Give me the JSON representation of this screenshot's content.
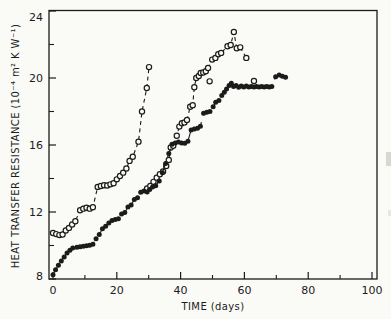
{
  "chart_data": {
    "type": "scatter",
    "title": "",
    "xlabel": "TIME (days)",
    "ylabel": "HEAT TRANSFER RESISTANCE (10⁻⁴ m² K W⁻¹)",
    "xlim": [
      0,
      100
    ],
    "ylim": [
      8,
      24
    ],
    "xticks_major": [
      0,
      20,
      40,
      60,
      80,
      100
    ],
    "xticks_minor": [
      10,
      30,
      50,
      70,
      90
    ],
    "yticks_major": [
      8,
      12,
      16,
      20,
      24
    ],
    "yticks_minor": [
      10,
      14,
      18,
      22
    ],
    "grid": false,
    "legend": "none",
    "colors": {
      "ink": "#1b1b1b",
      "background": "#fafaf7"
    },
    "series": [
      {
        "name": "run-1-open-circles",
        "marker": "open-circle",
        "line": "dashed",
        "points": [
          [
            0,
            10.75
          ],
          [
            1,
            10.68
          ],
          [
            2,
            10.62
          ],
          [
            3,
            10.66
          ],
          [
            4,
            10.9
          ],
          [
            5,
            11.05
          ],
          [
            6,
            11.25
          ],
          [
            7,
            11.45
          ],
          [
            8.5,
            12.1
          ],
          [
            9.5,
            12.2
          ],
          [
            10.5,
            12.25
          ],
          [
            11.5,
            12.2
          ],
          [
            12.5,
            12.28
          ],
          [
            14,
            13.5
          ],
          [
            15,
            13.55
          ],
          [
            16,
            13.6
          ],
          [
            17,
            13.58
          ],
          [
            18,
            13.65
          ],
          [
            19,
            13.72
          ],
          [
            20,
            13.95
          ],
          [
            21,
            14.15
          ],
          [
            22,
            14.35
          ],
          [
            23,
            14.6
          ],
          [
            24,
            15.05
          ],
          [
            25,
            15.3
          ],
          [
            26.8,
            16.2
          ],
          [
            27.9,
            18.0
          ],
          [
            29.4,
            19.4
          ],
          [
            30.1,
            20.65
          ]
        ],
        "no_line_points": []
      },
      {
        "name": "run-2-open-circles",
        "marker": "open-circle",
        "line": "dashed",
        "points": [
          [
            29.5,
            13.4
          ],
          [
            30.5,
            13.55
          ],
          [
            31.5,
            13.8
          ],
          [
            32.5,
            14.05
          ],
          [
            33.5,
            14.25
          ],
          [
            34.5,
            14.42
          ],
          [
            35.5,
            14.75
          ],
          [
            36.3,
            15.1
          ],
          [
            36.9,
            15.85
          ],
          [
            37.7,
            15.95
          ],
          [
            38.8,
            16.55
          ],
          [
            39.6,
            17.1
          ],
          [
            40.4,
            17.3
          ],
          [
            41.2,
            17.35
          ],
          [
            42,
            17.5
          ],
          [
            43,
            18.28
          ],
          [
            43.8,
            18.38
          ],
          [
            44.3,
            19.45
          ],
          [
            44.9,
            20.0
          ],
          [
            45.7,
            20.12
          ],
          [
            46.3,
            20.3
          ],
          [
            47.1,
            20.33
          ],
          [
            47.9,
            20.4
          ],
          [
            48.6,
            20.6
          ],
          [
            49.9,
            21.1
          ],
          [
            50.9,
            21.2
          ],
          [
            51.8,
            21.42
          ],
          [
            52.7,
            21.5
          ],
          [
            54.7,
            21.9
          ],
          [
            55.7,
            21.97
          ],
          [
            56.7,
            22.75
          ],
          [
            57.6,
            21.78
          ],
          [
            58.7,
            21.83
          ],
          [
            60.6,
            21.2
          ]
        ],
        "no_line_points": [
          [
            49.1,
            19.8
          ],
          [
            63,
            19.82
          ]
        ]
      },
      {
        "name": "run-3-filled-circles",
        "marker": "filled-circle",
        "line": "dashed-long",
        "points": [
          [
            0,
            8.25
          ],
          [
            0.8,
            8.55
          ],
          [
            1.7,
            8.82
          ],
          [
            2.6,
            9.08
          ],
          [
            3.5,
            9.32
          ],
          [
            4.4,
            9.55
          ],
          [
            5.3,
            9.72
          ],
          [
            6.2,
            9.85
          ],
          [
            7.5,
            9.9
          ],
          [
            8.5,
            9.92
          ],
          [
            9.5,
            9.95
          ],
          [
            10.5,
            9.98
          ],
          [
            11.5,
            10.02
          ],
          [
            12.5,
            10.08
          ],
          [
            13.5,
            10.4
          ],
          [
            14.5,
            10.65
          ],
          [
            15.5,
            11.0
          ],
          [
            16.5,
            11.15
          ],
          [
            17.5,
            11.35
          ],
          [
            18.5,
            11.5
          ],
          [
            19.5,
            11.55
          ],
          [
            20.5,
            11.6
          ],
          [
            21.5,
            11.88
          ],
          [
            22.5,
            11.97
          ],
          [
            23.5,
            12.3
          ],
          [
            24.5,
            12.42
          ],
          [
            25.5,
            12.75
          ],
          [
            26.5,
            12.85
          ],
          [
            27.5,
            13.18
          ],
          [
            28.5,
            13.25
          ],
          [
            29.5,
            13.2
          ],
          [
            30.3,
            13.35
          ],
          [
            31.2,
            13.5
          ],
          [
            32.2,
            13.57
          ],
          [
            33.3,
            13.85
          ],
          [
            34.3,
            14.35
          ],
          [
            35.3,
            14.9
          ],
          [
            36.3,
            15.5
          ],
          [
            37.3,
            16.05
          ],
          [
            38.3,
            16.12
          ],
          [
            39.3,
            16.18
          ],
          [
            40.3,
            16.12
          ],
          [
            41.3,
            16.1
          ],
          [
            42.3,
            16.22
          ],
          [
            43.3,
            16.9
          ],
          [
            44.3,
            16.95
          ],
          [
            45.3,
            17.0
          ],
          [
            46.2,
            17.12
          ],
          [
            47.2,
            17.9
          ],
          [
            48.2,
            17.95
          ],
          [
            49.2,
            18.0
          ],
          [
            50.2,
            18.28
          ],
          [
            51,
            18.55
          ],
          [
            52,
            18.65
          ],
          [
            52.9,
            18.95
          ],
          [
            53.7,
            19.15
          ],
          [
            54.4,
            19.35
          ],
          [
            55.2,
            19.55
          ],
          [
            55.9,
            19.68
          ],
          [
            56.6,
            19.5
          ],
          [
            57.4,
            19.55
          ],
          [
            58.2,
            19.45
          ],
          [
            59,
            19.52
          ],
          [
            59.8,
            19.46
          ],
          [
            60.6,
            19.52
          ],
          [
            61.4,
            19.46
          ],
          [
            62.2,
            19.5
          ],
          [
            63,
            19.46
          ],
          [
            63.8,
            19.5
          ],
          [
            64.6,
            19.47
          ],
          [
            65.4,
            19.5
          ],
          [
            66.2,
            19.46
          ],
          [
            67,
            19.5
          ],
          [
            67.8,
            19.47
          ],
          [
            68.6,
            19.5
          ],
          [
            69.8,
            20.08
          ],
          [
            70.9,
            20.18
          ],
          [
            71.9,
            20.1
          ],
          [
            72.9,
            20.05
          ]
        ],
        "no_line_points": []
      }
    ]
  }
}
